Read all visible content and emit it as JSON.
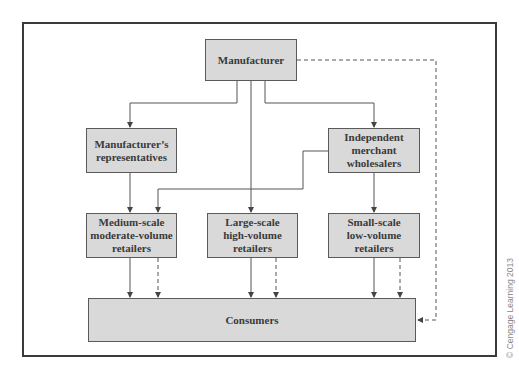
{
  "diagram": {
    "nodes": [
      {
        "id": "manufacturer",
        "label": "Manufacturer"
      },
      {
        "id": "reps",
        "label": "Manufacturer’s representatives"
      },
      {
        "id": "wholesalers",
        "label": "Independent merchant wholesalers"
      },
      {
        "id": "medium",
        "label": "Medium-scale moderate-volume retailers"
      },
      {
        "id": "large",
        "label": "Large-scale high-volume retailers"
      },
      {
        "id": "small",
        "label": "Small-scale low-volume retailers"
      },
      {
        "id": "consumers",
        "label": "Consumers"
      }
    ],
    "edges": [
      {
        "from": "manufacturer",
        "to": "reps",
        "style": "solid"
      },
      {
        "from": "manufacturer",
        "to": "large",
        "style": "solid"
      },
      {
        "from": "manufacturer",
        "to": "wholesalers",
        "style": "solid"
      },
      {
        "from": "manufacturer",
        "to": "consumers",
        "style": "dashed"
      },
      {
        "from": "reps",
        "to": "medium",
        "style": "solid"
      },
      {
        "from": "wholesalers",
        "to": "medium",
        "style": "solid"
      },
      {
        "from": "wholesalers",
        "to": "small",
        "style": "solid"
      },
      {
        "from": "medium",
        "to": "consumers",
        "style": "solid"
      },
      {
        "from": "medium",
        "to": "consumers",
        "style": "dashed"
      },
      {
        "from": "large",
        "to": "consumers",
        "style": "solid"
      },
      {
        "from": "large",
        "to": "consumers",
        "style": "dashed"
      },
      {
        "from": "small",
        "to": "consumers",
        "style": "solid"
      },
      {
        "from": "small",
        "to": "consumers",
        "style": "dashed"
      }
    ]
  },
  "copyright": "© Cengage Learning 2013"
}
